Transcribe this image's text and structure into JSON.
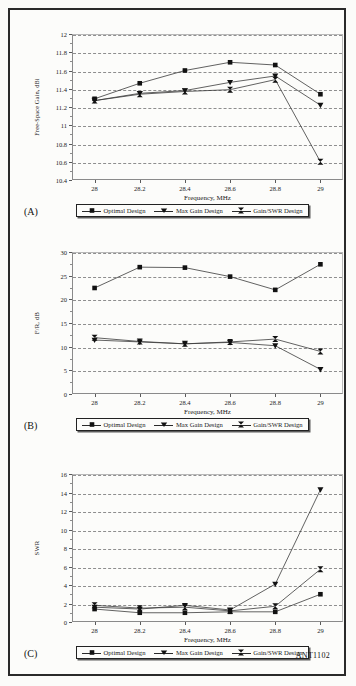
{
  "figure": {
    "credit": "ANT1102",
    "series_names": [
      "Optimal Design",
      "Max Gain Design",
      "Gain/SWR Design"
    ],
    "x_title": "Frequency, MHz",
    "x_categories": [
      "28",
      "28.2",
      "28.4",
      "28.6",
      "28.8",
      "29"
    ]
  },
  "panels": [
    {
      "id": "A",
      "label": "(A)",
      "y_title": "Free-Space Gain, dBi"
    },
    {
      "id": "B",
      "label": "(B)",
      "y_title": "F/R, dB"
    },
    {
      "id": "C",
      "label": "(C)",
      "y_title": "SWR"
    }
  ],
  "legend": {
    "items": [
      {
        "label": "Optimal Design",
        "marker": "square"
      },
      {
        "label": "Max Gain Design",
        "marker": "triangle-down"
      },
      {
        "label": "Gain/SWR Design",
        "marker": "bowtie"
      }
    ]
  },
  "chart_data": [
    {
      "type": "line",
      "panel": "A",
      "title": "",
      "xlabel": "Frequency, MHz",
      "ylabel": "Free-Space Gain, dBi",
      "x": [
        28,
        28.2,
        28.4,
        28.6,
        28.8,
        29
      ],
      "categories": [
        "28",
        "28.2",
        "28.4",
        "28.6",
        "28.8",
        "29"
      ],
      "ylim": [
        10.4,
        12
      ],
      "yticks": [
        10.4,
        10.6,
        10.8,
        11,
        11.2,
        11.4,
        11.6,
        11.8,
        12
      ],
      "ytick_labels": [
        "10.4",
        "10.6",
        "10.8",
        "11",
        "11.2",
        "11.4",
        "11.6",
        "11.8",
        "12"
      ],
      "grid": true,
      "legend_position": "below",
      "series": [
        {
          "name": "Optimal Design",
          "marker": "square",
          "values": [
            11.29,
            11.46,
            11.6,
            11.69,
            11.66,
            11.34
          ]
        },
        {
          "name": "Max Gain Design",
          "marker": "triangle-down",
          "values": [
            11.27,
            11.35,
            11.38,
            11.47,
            11.54,
            11.22
          ]
        },
        {
          "name": "Gain/SWR Design",
          "marker": "bowtie",
          "values": [
            11.27,
            11.34,
            11.37,
            11.39,
            11.5,
            10.6
          ]
        }
      ]
    },
    {
      "type": "line",
      "panel": "B",
      "title": "",
      "xlabel": "Frequency, MHz",
      "ylabel": "F/R, dB",
      "x": [
        28,
        28.2,
        28.4,
        28.6,
        28.8,
        29
      ],
      "categories": [
        "28",
        "28.2",
        "28.4",
        "28.6",
        "28.8",
        "29"
      ],
      "ylim": [
        0,
        30
      ],
      "yticks": [
        0,
        5,
        10,
        15,
        20,
        25,
        30
      ],
      "ytick_labels": [
        "0",
        "5",
        "10",
        "15",
        "20",
        "25",
        "30"
      ],
      "grid": true,
      "legend_position": "below",
      "series": [
        {
          "name": "Optimal Design",
          "marker": "square",
          "values": [
            22.4,
            26.8,
            26.7,
            24.8,
            22.0,
            27.4
          ]
        },
        {
          "name": "Max Gain Design",
          "marker": "triangle-down",
          "values": [
            11.4,
            11.0,
            10.6,
            10.9,
            10.2,
            5.2
          ]
        },
        {
          "name": "Gain/SWR Design",
          "marker": "bowtie",
          "values": [
            11.9,
            11.1,
            10.6,
            11.0,
            11.6,
            9.0
          ]
        }
      ]
    },
    {
      "type": "line",
      "panel": "C",
      "title": "",
      "xlabel": "Frequency, MHz",
      "ylabel": "SWR",
      "x": [
        28,
        28.2,
        28.4,
        28.6,
        28.8,
        29
      ],
      "categories": [
        "28",
        "28.2",
        "28.4",
        "28.6",
        "28.8",
        "29"
      ],
      "ylim": [
        0,
        16
      ],
      "yticks": [
        0,
        2,
        4,
        6,
        8,
        10,
        12,
        14,
        16
      ],
      "ytick_labels": [
        "0",
        "2",
        "4",
        "6",
        "8",
        "10",
        "12",
        "14",
        "16"
      ],
      "grid": true,
      "legend_position": "below",
      "series": [
        {
          "name": "Optimal Design",
          "marker": "square",
          "values": [
            1.4,
            1.0,
            1.0,
            1.1,
            1.1,
            3.0
          ]
        },
        {
          "name": "Max Gain Design",
          "marker": "triangle-down",
          "values": [
            1.6,
            1.4,
            1.8,
            1.3,
            4.1,
            14.3
          ]
        },
        {
          "name": "Gain/SWR Design",
          "marker": "bowtie",
          "values": [
            1.8,
            1.5,
            1.6,
            1.2,
            1.7,
            5.7
          ]
        }
      ]
    }
  ]
}
